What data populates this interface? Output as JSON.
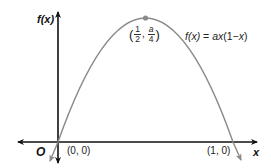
{
  "diagram": {
    "y_axis_label": "f(x)",
    "x_axis_label": "x",
    "origin_label": "O",
    "equation": {
      "lhs": "f(x)",
      "eq": "=",
      "rhs_a": "a",
      "rhs_x": "x",
      "rhs_paren": "(1−",
      "rhs_x2": "x",
      "rhs_close": ")"
    },
    "points": [
      {
        "name": "origin-point",
        "label": "(0, 0)"
      },
      {
        "name": "root-point",
        "label": "(1, 0)"
      }
    ],
    "vertex": {
      "open": "(",
      "x_num": "1",
      "x_den": "2",
      "sep": ",",
      "y_num": "a",
      "y_den": "4",
      "close": ")"
    },
    "colors": {
      "axes": "#111111",
      "curve": "#8a8a8a",
      "vertex_dot": "#8a8a8a"
    }
  }
}
